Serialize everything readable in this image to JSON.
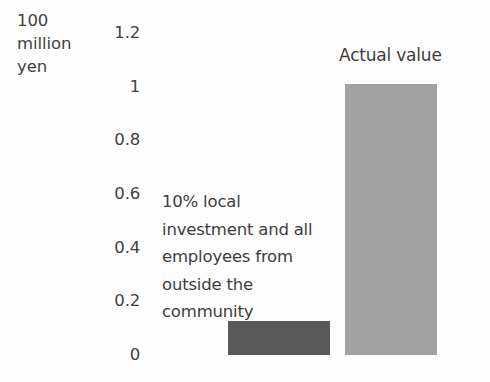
{
  "chart_data": {
    "type": "bar",
    "title": "",
    "xlabel": "",
    "ylabel": "100 million yen",
    "ylim": [
      0,
      1.2
    ],
    "ytick_labels": [
      "1.2",
      "1",
      "0.8",
      "0.6",
      "0.4",
      "0.2",
      "0"
    ],
    "ytick_values": [
      1.2,
      1.0,
      0.8,
      0.6,
      0.4,
      0.2,
      0
    ],
    "grid": false,
    "legend": "none",
    "categories": [
      "10% local investment and all employees from outside the community",
      "Actual value"
    ],
    "values": [
      0.125,
      1.01
    ],
    "bar_colors": [
      "#595959",
      "#a2a2a2"
    ],
    "annotations": [
      {
        "text": "10% local investment and all employees from outside the community",
        "position": "left-of-first-bar"
      },
      {
        "text": "Actual value",
        "position": "above-second-bar"
      }
    ]
  },
  "axis": {
    "unit_title_lines": [
      "100",
      "million",
      "yen"
    ],
    "unit_title": "100 million yen"
  },
  "labels": {
    "scenario_annotation": "10% local investment and all employees from outside the community",
    "actual_value": "Actual value"
  },
  "colors": {
    "background": "#fdfdfd",
    "text": "#3d3d3d",
    "bar_scenario": "#595959",
    "bar_actual": "#a2a2a2"
  }
}
